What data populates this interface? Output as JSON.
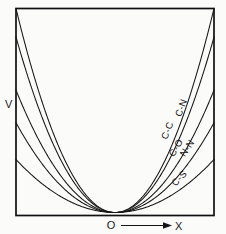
{
  "figure": {
    "background_color": "#fbfbfa",
    "line_color": "#151515",
    "frame_color": "#101010"
  },
  "axes": {
    "y_label": "V",
    "x_label": "X",
    "origin_label": "O"
  },
  "chart_data": {
    "type": "line",
    "title": "",
    "subtitle": "",
    "xlabel": "X",
    "ylabel": "V",
    "grid": false,
    "legend_position": "inline-curve-labels",
    "annotations": [
      "O",
      "X",
      "V"
    ],
    "xlim": [
      -1,
      1
    ],
    "ylim": [
      0,
      1
    ],
    "x": [
      -1.0,
      -0.9,
      -0.8,
      -0.7,
      -0.6,
      -0.5,
      -0.4,
      -0.3,
      -0.2,
      -0.1,
      0.0,
      0.1,
      0.2,
      0.3,
      0.4,
      0.5,
      0.6,
      0.7,
      0.8,
      0.9,
      1.0
    ],
    "series": [
      {
        "name": "C-C",
        "label": "C-C",
        "curvature": 1.0,
        "values": [
          1.0,
          0.81,
          0.64,
          0.49,
          0.36,
          0.25,
          0.16,
          0.09,
          0.04,
          0.01,
          0.0,
          0.01,
          0.04,
          0.09,
          0.16,
          0.25,
          0.36,
          0.49,
          0.64,
          0.81,
          1.0
        ],
        "label_x": 0.62,
        "label_y": 0.42
      },
      {
        "name": "C-N",
        "label": "C-N",
        "curvature": 0.86,
        "values": [
          0.86,
          0.7,
          0.55,
          0.42,
          0.31,
          0.215,
          0.138,
          0.077,
          0.034,
          0.009,
          0.0,
          0.009,
          0.034,
          0.077,
          0.138,
          0.215,
          0.31,
          0.42,
          0.55,
          0.7,
          0.86
        ],
        "label_x": 0.76,
        "label_y": 0.5
      },
      {
        "name": "C-O",
        "label": "C-O",
        "curvature": 0.6,
        "values": [
          0.6,
          0.486,
          0.384,
          0.294,
          0.216,
          0.15,
          0.096,
          0.054,
          0.024,
          0.006,
          0.0,
          0.006,
          0.024,
          0.054,
          0.096,
          0.15,
          0.216,
          0.294,
          0.384,
          0.486,
          0.6
        ],
        "label_x": 0.7,
        "label_y": 0.285
      },
      {
        "name": "N-N",
        "label": "N-N",
        "curvature": 0.44,
        "values": [
          0.44,
          0.356,
          0.282,
          0.216,
          0.158,
          0.11,
          0.07,
          0.04,
          0.018,
          0.004,
          0.0,
          0.004,
          0.018,
          0.04,
          0.07,
          0.11,
          0.158,
          0.216,
          0.282,
          0.356,
          0.44
        ],
        "label_x": 0.81,
        "label_y": 0.245
      },
      {
        "name": "C-S",
        "label": "C-S",
        "curvature": 0.26,
        "values": [
          0.26,
          0.211,
          0.166,
          0.127,
          0.094,
          0.065,
          0.042,
          0.023,
          0.01,
          0.003,
          0.0,
          0.003,
          0.01,
          0.023,
          0.042,
          0.065,
          0.094,
          0.127,
          0.166,
          0.211,
          0.26
        ],
        "label_x": 0.72,
        "label_y": 0.115
      }
    ]
  }
}
